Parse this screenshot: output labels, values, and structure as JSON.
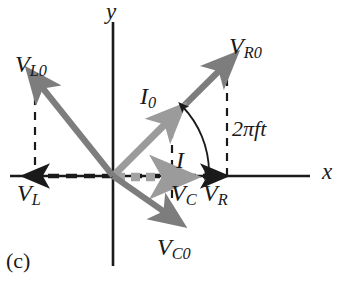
{
  "figure": {
    "panel_label": "(c)",
    "caption_type": "phasor-diagram",
    "axes": {
      "x_label": "x",
      "y_label": "y",
      "origin_px": [
        113,
        176
      ],
      "x_axis_span_px": [
        10,
        310
      ],
      "y_axis_span_px": [
        22,
        266
      ]
    },
    "angle_annotation": {
      "label_pi": "2πft",
      "label_parts": {
        "coefficient": "2",
        "pi": "π",
        "f": "f",
        "t": "t"
      },
      "arc_from_deg": 0,
      "arc_to_deg": 45
    },
    "colors": {
      "phasor_gray": "#7d7d7d",
      "phasor_light_gray": "#9b9b9b",
      "axis_black": "#1a1a1a",
      "dashed_black": "#1a1a1a",
      "background": "#ffffff"
    },
    "vectors": [
      {
        "name": "V_R0",
        "label_main": "V",
        "label_sub": "R0",
        "label_text": "VR0",
        "style": "solid-gray-arrow",
        "angle_deg": 45,
        "magnitude_px": 161,
        "tip_px": [
          227,
          63
        ],
        "label_px": [
          231,
          36
        ]
      },
      {
        "name": "I_0",
        "label_main": "I",
        "label_sub": "0",
        "label_text": "I0",
        "style": "solid-lightgray-arrow",
        "angle_deg": 45,
        "magnitude_px": 83,
        "tip_px": [
          172,
          117
        ],
        "label_px": [
          141,
          85
        ]
      },
      {
        "name": "V_L0",
        "label_main": "V",
        "label_sub": "L0",
        "label_text": "VL0",
        "style": "solid-gray-arrow",
        "angle_deg": 135,
        "magnitude_px": 120,
        "tip_px": [
          35,
          80
        ],
        "label_px": [
          16,
          52
        ]
      },
      {
        "name": "V_C0",
        "label_main": "V",
        "label_sub": "C0",
        "label_text": "VC0",
        "style": "solid-gray-arrow",
        "angle_deg": -45,
        "magnitude_px": 75,
        "tip_px": [
          172,
          220
        ],
        "label_px": [
          160,
          238
        ]
      },
      {
        "name": "V_R",
        "label_main": "V",
        "label_sub": "R",
        "label_text": "VR",
        "style": "dashed-black-arrow",
        "angle_deg": 0,
        "magnitude_px": 102,
        "tip_px": [
          215,
          176
        ],
        "label_px": [
          205,
          180
        ]
      },
      {
        "name": "V_L",
        "label_main": "V",
        "label_sub": "L",
        "label_text": "VL",
        "style": "dashed-black-arrow",
        "angle_deg": 180,
        "magnitude_px": 78,
        "tip_px": [
          35,
          176
        ],
        "label_px": [
          18,
          180
        ]
      },
      {
        "name": "I",
        "label_main": "I",
        "label_sub": "",
        "label_text": "I",
        "style": "dashed-gray-arrow",
        "angle_deg": 0,
        "magnitude_px": 59,
        "tip_px": [
          172,
          176
        ],
        "label_px": [
          175,
          148
        ]
      },
      {
        "name": "V_C",
        "label_main": "V",
        "label_sub": "C",
        "label_text": "VC",
        "style": "projection-label-only",
        "angle_deg": 0,
        "magnitude_px": 59,
        "tip_px": [
          172,
          176
        ],
        "label_px": [
          172,
          180
        ]
      }
    ],
    "projection_lines": [
      {
        "name": "proj-VL0",
        "x_px": 35,
        "y_from_px": 82,
        "y_to_px": 176
      },
      {
        "name": "proj-VR0",
        "x_px": 227,
        "y_from_px": 63,
        "y_to_px": 176
      },
      {
        "name": "proj-I0-VC0",
        "x_px": 172,
        "y_from_px": 115,
        "y_to_px": 220
      }
    ]
  }
}
